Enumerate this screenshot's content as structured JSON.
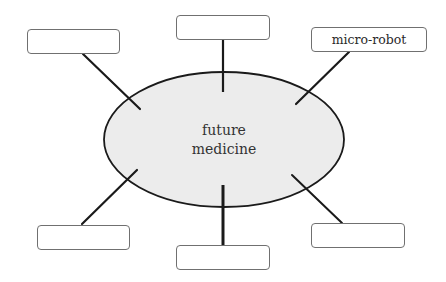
{
  "diagram": {
    "type": "mind-map",
    "center": {
      "line1": "future",
      "line2": "medicine",
      "fill": "#ececec",
      "stroke": "#1a1a1a"
    },
    "nodes": [
      {
        "id": "top-left",
        "label": ""
      },
      {
        "id": "top-center",
        "label": ""
      },
      {
        "id": "top-right",
        "label": "micro-robot"
      },
      {
        "id": "bottom-left",
        "label": ""
      },
      {
        "id": "bottom-center",
        "label": ""
      },
      {
        "id": "bottom-right",
        "label": ""
      }
    ],
    "colors": {
      "box_border": "#707070",
      "connector": "#1a1a1a",
      "background": "#ffffff"
    }
  }
}
